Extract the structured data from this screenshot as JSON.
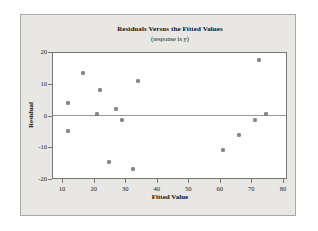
{
  "figure": {
    "kind": "minitab-style residual plot",
    "background": "#ffffff"
  },
  "colors": {
    "panel_bg": "#e8e7e3",
    "panel_border": "#a9a9a5",
    "plot_bg": "#ffffff",
    "frame": "#777777",
    "tick": "#777777",
    "text": "#111111",
    "zero_line": "#9b958d",
    "point": "#8a8a8a"
  },
  "chart_data": {
    "type": "scatter",
    "title": "Residuals Versus the Fitted Values",
    "subtitle": "(response is y)",
    "xlabel": "Fitted Value",
    "ylabel": "Residual",
    "xlim": [
      6.8,
      81.3
    ],
    "ylim": [
      -20,
      20
    ],
    "x_ticks": [
      10,
      20,
      30,
      40,
      50,
      60,
      70,
      80
    ],
    "y_ticks": [
      20,
      10,
      0,
      -10,
      -20
    ],
    "zero_line": 0,
    "grid": false,
    "legend": false,
    "points": [
      [
        12,
        4
      ],
      [
        12,
        -5
      ],
      [
        16.5,
        13.5
      ],
      [
        21,
        0.5
      ],
      [
        22,
        8
      ],
      [
        25,
        -14.5
      ],
      [
        27,
        2
      ],
      [
        29,
        -1.5
      ],
      [
        32.5,
        -17
      ],
      [
        34,
        11
      ],
      [
        61,
        -11
      ],
      [
        66,
        -6
      ],
      [
        71,
        -1.5
      ],
      [
        72.5,
        17.5
      ],
      [
        74.5,
        0.5
      ]
    ]
  }
}
